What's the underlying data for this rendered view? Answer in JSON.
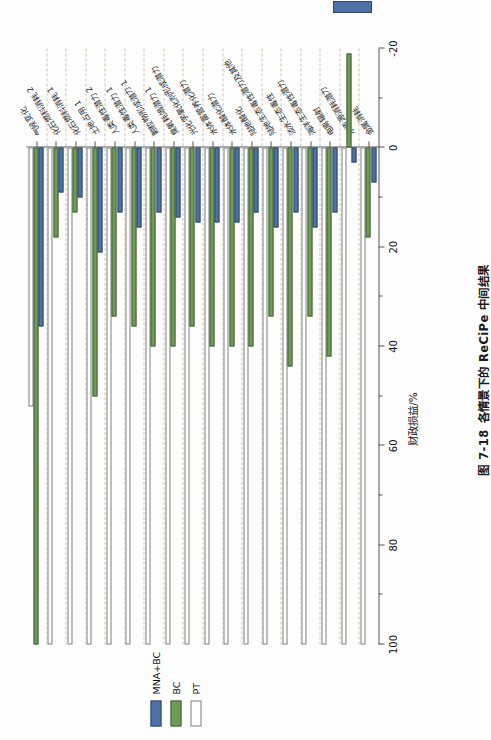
{
  "figure": {
    "caption_number": "图 7-18",
    "caption_text": "各情景下的 ReCiPe 中间结果"
  },
  "legend": {
    "items": [
      {
        "label": "MNA+BC",
        "color": "#4c72a8",
        "key": "mna_bc"
      },
      {
        "label": "BC",
        "color": "#6f9b57",
        "key": "bc"
      },
      {
        "label": "PT",
        "color": "#ffffff",
        "key": "pt"
      }
    ]
  },
  "axis": {
    "title": "财政损益/%",
    "ticks": [
      100,
      80,
      60,
      40,
      20,
      0,
      -20
    ],
    "minor_ticks": [
      90,
      70,
      50,
      30,
      10,
      -10
    ],
    "min": -20,
    "max": 100,
    "grid": "dashed"
  },
  "chart_data": {
    "type": "bar",
    "orientation": "horizontal",
    "title": "各情景下的 ReCiPe 中间结果",
    "xlabel": "财政损益/%",
    "ylabel": "",
    "xlim": [
      -20,
      100
    ],
    "grid": true,
    "legend_position": "left",
    "categories": [
      "气候变化",
      "化石燃料消耗 2",
      "化石燃料消耗 1",
      "土地占用 1",
      "人类毒性潜力 2",
      "人类毒性潜力 1",
      "颗粒物形成潜力 1",
      "臭氧耗竭潜力 1",
      "光化学氧化剂形成潜力",
      "水体富营养化潜力",
      "水体酸化潜力",
      "陆地酸化",
      "陆地生态毒性潜力及其他",
      "淡水生态毒性",
      "海洋生态毒性潜力",
      "电离辐射",
      "水资源消耗潜力",
      "金属消耗"
    ],
    "series": [
      {
        "name": "MNA+BC",
        "color": "#4c72a8",
        "values": [
          36,
          9,
          10,
          21,
          13,
          16,
          13,
          14,
          15,
          15,
          15,
          13,
          16,
          13,
          16,
          13,
          3,
          7
        ]
      },
      {
        "name": "BC",
        "color": "#6f9b57",
        "values": [
          100,
          18,
          13,
          50,
          34,
          36,
          40,
          40,
          36,
          40,
          40,
          40,
          34,
          44,
          34,
          42,
          -19,
          18
        ]
      },
      {
        "name": "PT",
        "color": "#ffffff",
        "values": [
          52,
          100,
          100,
          100,
          100,
          100,
          100,
          100,
          100,
          100,
          100,
          100,
          100,
          100,
          100,
          100,
          100,
          100
        ]
      }
    ]
  }
}
